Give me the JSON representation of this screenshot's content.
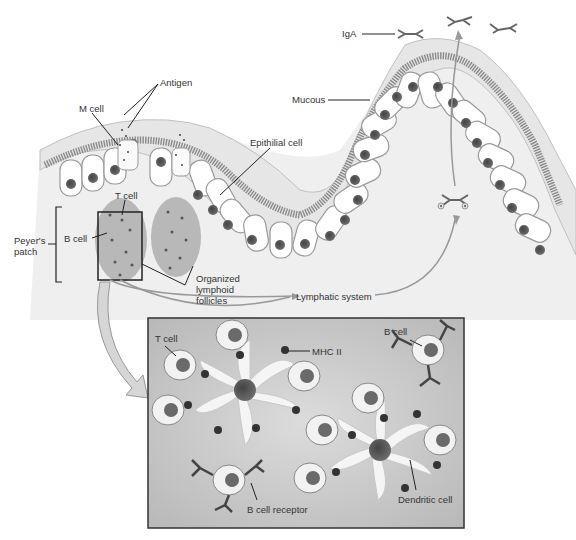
{
  "diagram": {
    "labels": {
      "iga": "IgA",
      "antigen": "Antigen",
      "m_cell": "M cell",
      "mucous": "Mucous",
      "epithelial_cell": "Epithilial cell",
      "t_cell_top": "T cell",
      "b_cell_top": "B cell",
      "peyers_patch_line1": "Peyer's",
      "peyers_patch_line2": "patch",
      "organized_line1": "Organized",
      "organized_line2": "lymphoid",
      "organized_line3": "follicles",
      "lymphatic_system": "Lymphatic system",
      "inset_t_cell": "T cell",
      "inset_mhc": "MHC II",
      "inset_b_cell": "B cell",
      "inset_b_receptor": "B cell receptor",
      "inset_dendritic": "Dendritic cell"
    },
    "colors": {
      "mucous": "#e6e6e6",
      "microvilli": "#8a8a8a",
      "cell_fill": "#ffffff",
      "nucleus": "#555555",
      "follicle": "#b8b8b8",
      "inset_bg": "#c4c4c4",
      "arrow": "#999999",
      "line": "#222222"
    }
  }
}
